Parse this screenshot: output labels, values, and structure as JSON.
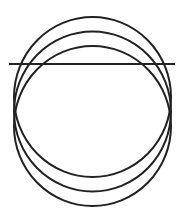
{
  "diagram": {
    "type": "geometric-figure",
    "stroke_color": "#222222",
    "stroke_width": 2,
    "circles": [
      {
        "cx": 92.5,
        "cy": 97,
        "rx": 78.5,
        "ry": 80
      },
      {
        "cx": 92.5,
        "cy": 111.5,
        "rx": 78.5,
        "ry": 80
      },
      {
        "cx": 92.5,
        "cy": 126,
        "rx": 78.5,
        "ry": 80
      }
    ],
    "line": {
      "x1": 9,
      "y1": 64,
      "x2": 175,
      "y2": 64
    }
  }
}
